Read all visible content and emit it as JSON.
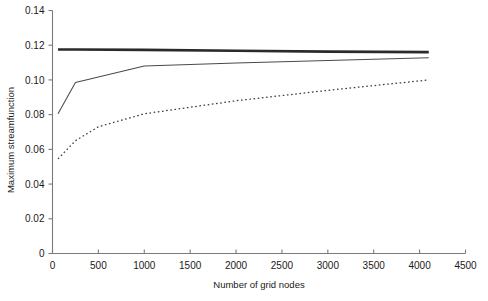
{
  "chart_data": {
    "type": "line",
    "title": "",
    "xlabel": "Number of grid nodes",
    "ylabel": "Maximum streamfunction",
    "xlim": [
      0,
      4500
    ],
    "ylim": [
      0,
      0.14
    ],
    "grid": false,
    "legend": "none",
    "xticks": [
      0,
      500,
      1000,
      1500,
      2000,
      2500,
      3000,
      3500,
      4000,
      4500
    ],
    "xtick_labels": [
      "0",
      "500",
      "1000",
      "1500",
      "2000",
      "2500",
      "3000",
      "3500",
      "4000",
      "4500"
    ],
    "yticks": [
      0,
      0.02,
      0.04,
      0.06,
      0.08,
      0.1,
      0.12,
      0.14
    ],
    "ytick_labels": [
      "0",
      "0.02",
      "0.04",
      "0.06",
      "0.08",
      "0.10",
      "0.12",
      "0.14"
    ],
    "series": [
      {
        "name": "thick-solid-curve",
        "style": "thick-solid",
        "color": "#2a2a2a",
        "x": [
          60,
          250,
          1000,
          2000,
          3000,
          4100
        ],
        "values": [
          0.1175,
          0.1175,
          0.1173,
          0.1168,
          0.1163,
          0.116
        ]
      },
      {
        "name": "thin-solid-curve",
        "style": "thin-solid",
        "color": "#4a4a4a",
        "x": [
          60,
          250,
          1000,
          2000,
          3000,
          4100
        ],
        "values": [
          0.0805,
          0.0985,
          0.108,
          0.1098,
          0.1112,
          0.1128
        ]
      },
      {
        "name": "dotted-curve",
        "style": "dotted",
        "color": "#3a3a3a",
        "x": [
          60,
          250,
          500,
          1000,
          2000,
          3000,
          4100
        ],
        "values": [
          0.0545,
          0.065,
          0.073,
          0.0805,
          0.088,
          0.094,
          0.1
        ]
      }
    ]
  },
  "axes": {
    "x_title": "Number of grid nodes",
    "y_title": "Maximum streamfunction"
  }
}
